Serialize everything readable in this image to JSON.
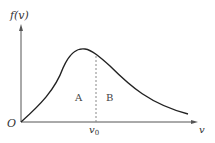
{
  "diagram": {
    "y_axis_label": "f(v)",
    "x_axis_label": "v",
    "origin_label": "O",
    "marker_label": "v",
    "marker_subscript": "0",
    "region_left": "A",
    "region_right": "B",
    "colors": {
      "axis": "#555555",
      "curve": "#222222",
      "dashed": "#888888",
      "text": "#333333"
    }
  }
}
